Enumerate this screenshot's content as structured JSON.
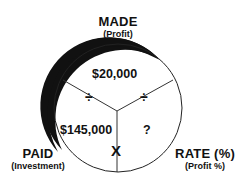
{
  "diagram": {
    "type": "profit-circle",
    "sections": {
      "top": {
        "label": "MADE",
        "sublabel": "(Profit)",
        "value": "$20,000"
      },
      "left": {
        "label": "PAID",
        "sublabel": "(Investment)",
        "value": "$145,000"
      },
      "right": {
        "label": "RATE (%)",
        "sublabel": "(Profit %)",
        "value": "?"
      }
    },
    "operators": {
      "left_divider": "÷",
      "right_divider": "÷",
      "bottom_divider": "X"
    },
    "colors": {
      "ink": "#111111",
      "background": "#ffffff"
    }
  }
}
